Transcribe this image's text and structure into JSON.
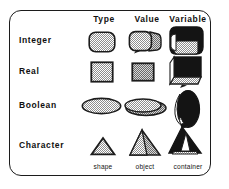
{
  "figure": {
    "kind": "diagram",
    "frame": {
      "style": "rounded-rectangle-border",
      "color": "#1c1c1c"
    },
    "columns": [
      {
        "id": "type",
        "label": "Type",
        "footer": "shape"
      },
      {
        "id": "value",
        "label": "Value",
        "footer": "object"
      },
      {
        "id": "variable",
        "label": "Variable",
        "footer": "container"
      }
    ],
    "rows": [
      {
        "id": "integer",
        "label": "Integer",
        "cells": {
          "type": {
            "glyph": "rounded-rectangle-outline",
            "fill": "stipple"
          },
          "value": {
            "glyph": "rounded-rectangle-3d",
            "fill": "stipple"
          },
          "variable": {
            "glyph": "rounded-rectangle-container",
            "fill": "solid-dark"
          }
        }
      },
      {
        "id": "real",
        "label": "Real",
        "cells": {
          "type": {
            "glyph": "square-outline",
            "fill": "stipple"
          },
          "value": {
            "glyph": "square-filled",
            "fill": "stipple"
          },
          "variable": {
            "glyph": "cube-container",
            "fill": "solid-dark"
          }
        }
      },
      {
        "id": "boolean",
        "label": "Boolean",
        "cells": {
          "type": {
            "glyph": "ellipse-outline",
            "fill": "stipple"
          },
          "value": {
            "glyph": "ellipse-3d",
            "fill": "stipple"
          },
          "variable": {
            "glyph": "ellipse-vertical-container",
            "fill": "solid-dark"
          }
        }
      },
      {
        "id": "character",
        "label": "Character",
        "cells": {
          "type": {
            "glyph": "triangle-outline",
            "fill": "stipple"
          },
          "value": {
            "glyph": "triangle-3d",
            "fill": "stipple"
          },
          "variable": {
            "glyph": "triangle-container",
            "fill": "solid-dark"
          }
        }
      }
    ],
    "colors": {
      "ink": "#1c1c1c",
      "stipple": "#9a9a9a",
      "dark": "#141414",
      "paper": "#ffffff"
    }
  }
}
